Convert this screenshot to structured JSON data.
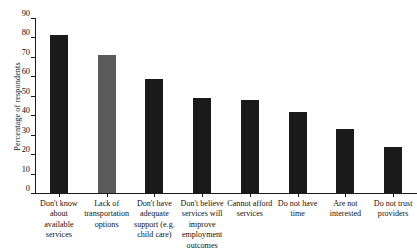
{
  "chart_data": {
    "type": "bar",
    "title": "",
    "xlabel": "",
    "ylabel": "Percentage of respondents",
    "ylim": [
      0,
      90
    ],
    "ytick_step": 10,
    "yticks": [
      0,
      10,
      20,
      30,
      40,
      50,
      60,
      70,
      80,
      90
    ],
    "grid": false,
    "legend": "none",
    "bar_colors": {
      "default": "#1a1a1a",
      "highlight": "#5a5a5a"
    },
    "categories": [
      "Don't know about available services",
      "Lack of transportation options",
      "Don't have adequate support (e.g. child care)",
      "Don't believe services will improve employment outcomes",
      "Cannot afford services",
      "Do not have time",
      "Are not interested",
      "Do not trust providers"
    ],
    "category_lines": [
      [
        "Don't know",
        "about",
        "available",
        "services"
      ],
      [
        "Lack of",
        "transportation",
        "options"
      ],
      [
        "Don't have",
        "adequate",
        "support (e.g.",
        "child care)"
      ],
      [
        "Don't believe",
        "services will",
        "improve",
        "employment",
        "outcomes"
      ],
      [
        "Cannot afford",
        "services"
      ],
      [
        "Do not have",
        "time"
      ],
      [
        "Are not",
        "interested"
      ],
      [
        "Do not trust",
        "providers"
      ]
    ],
    "values": [
      81.5,
      71,
      58.5,
      49,
      48,
      41.5,
      33,
      23.5
    ],
    "series": [
      {
        "name": "Percentage of respondents",
        "values": [
          81.5,
          71,
          58.5,
          49,
          48,
          41.5,
          33,
          23.5
        ]
      }
    ]
  }
}
